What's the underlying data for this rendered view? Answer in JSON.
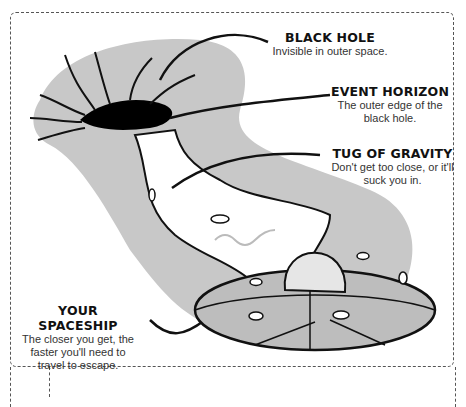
{
  "diagram": {
    "labels": [
      {
        "id": "black-hole",
        "title": "BLACK HOLE",
        "description": "Invisible in outer space."
      },
      {
        "id": "event-horizon",
        "title": "EVENT HORIZON",
        "description": "The outer edge of the black hole."
      },
      {
        "id": "tug-of-gravity",
        "title": "TUG OF GRAVITY",
        "description": "Don't get too close, or it'll suck you in."
      },
      {
        "id": "your-spaceship",
        "title": "YOUR SPACESHIP",
        "description": "The closer you get, the faster you'll need to travel to escape."
      }
    ],
    "colors": {
      "background": "#ffffff",
      "halo": "#c8c8c8",
      "halo_dark": "#9a9a9a",
      "hole": "#000000",
      "saucer_light": "#bdbdbd",
      "saucer_dark": "#8f8f8f",
      "outline": "#111111"
    }
  }
}
